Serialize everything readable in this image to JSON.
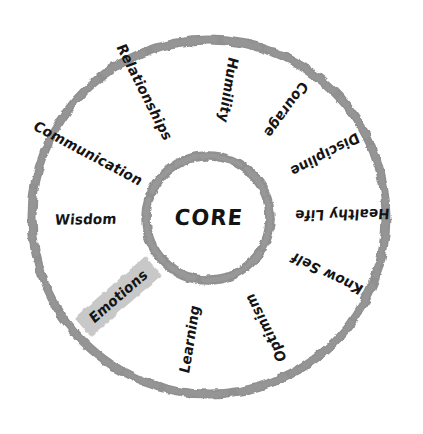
{
  "diagram": {
    "type": "concentric-wheel",
    "center_label": "CORE",
    "background_color": "#ffffff",
    "stroke_color": "#909090",
    "text_color": "#141414",
    "highlight_color": "#c8c8c8",
    "geometry": {
      "center_x": 209,
      "center_y": 217,
      "outer_radius": 177,
      "inner_radius": 62,
      "stroke_width": 9
    },
    "segments": [
      {
        "label": "Communication",
        "angle_deg": 208,
        "radius": 137,
        "rotation_deg": 28,
        "highlighted": false
      },
      {
        "label": "Relationships",
        "angle_deg": 243,
        "radius": 140,
        "rotation_deg": 63,
        "highlighted": false
      },
      {
        "label": "Humility",
        "angle_deg": 279,
        "radius": 129,
        "rotation_deg": 99,
        "highlighted": false
      },
      {
        "label": "Courage",
        "angle_deg": 306,
        "radius": 132,
        "rotation_deg": 126,
        "highlighted": false
      },
      {
        "label": "Discipline",
        "angle_deg": 332,
        "radius": 131,
        "rotation_deg": 152,
        "highlighted": false
      },
      {
        "label": "Healthy Life",
        "angle_deg": 359,
        "radius": 133,
        "rotation_deg": 179,
        "highlighted": false
      },
      {
        "label": "Know Self",
        "angle_deg": 26,
        "radius": 131,
        "rotation_deg": 206,
        "highlighted": false
      },
      {
        "label": "Optimism",
        "angle_deg": 63,
        "radius": 125,
        "rotation_deg": 243,
        "highlighted": false
      },
      {
        "label": "Learning",
        "angle_deg": 99,
        "radius": 124,
        "rotation_deg": 279,
        "highlighted": false
      },
      {
        "label": "Emotions",
        "angle_deg": 139,
        "radius": 120,
        "rotation_deg": 319,
        "highlighted": true
      },
      {
        "label": "Wisdom",
        "angle_deg": 179,
        "radius": 123,
        "rotation_deg": 359,
        "highlighted": false
      }
    ]
  }
}
